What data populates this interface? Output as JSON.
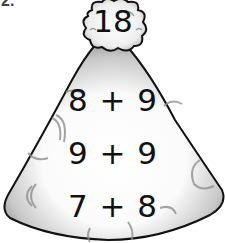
{
  "question_number": "2.",
  "cloud": {
    "value": "18"
  },
  "volcano": {
    "expressions": [
      "8 + 9",
      "9 + 9",
      "7 + 8"
    ]
  },
  "colors": {
    "outline": "#111111",
    "shade": "#9a9a9a",
    "fill": "#ffffff"
  }
}
